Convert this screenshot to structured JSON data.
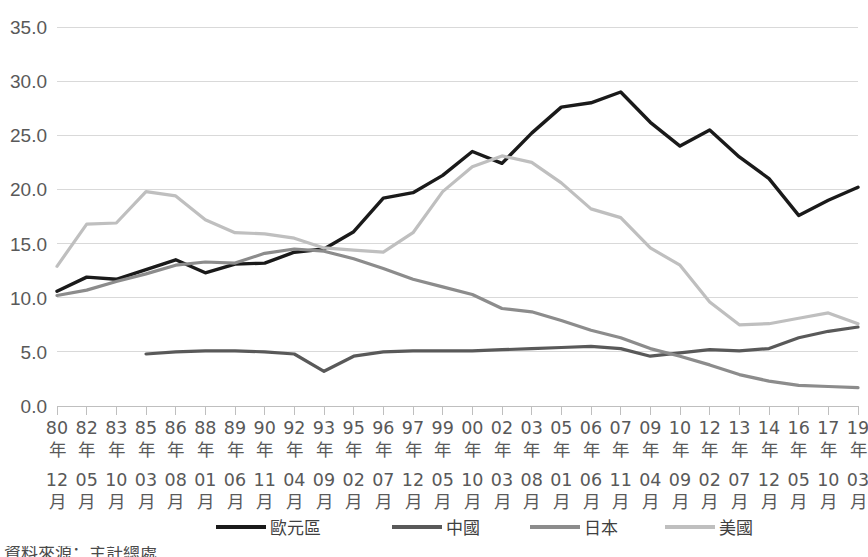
{
  "chart_data": {
    "type": "line",
    "title": "",
    "subtitle": "",
    "xlabel": "",
    "ylabel": "",
    "grid": true,
    "legend_position": "bottom",
    "ylim": [
      0.0,
      35.0
    ],
    "yticks": [
      "0.0",
      "5.0",
      "10.0",
      "15.0",
      "20.0",
      "25.0",
      "30.0",
      "35.0"
    ],
    "ytick_values": [
      0.0,
      5.0,
      10.0,
      15.0,
      20.0,
      25.0,
      30.0,
      35.0
    ],
    "categories": [
      "80年12月",
      "82年05月",
      "83年10月",
      "85年03月",
      "86年08月",
      "88年01月",
      "89年06月",
      "90年11月",
      "92年04月",
      "93年09月",
      "95年02月",
      "96年07月",
      "97年12月",
      "99年05月",
      "00年10月",
      "02年03月",
      "03年08月",
      "05年01月",
      "06年06月",
      "07年11月",
      "09年04月",
      "10年09月",
      "12年02月",
      "13年07月",
      "14年12月",
      "16年05月",
      "17年10月",
      "19年03月"
    ],
    "series": [
      {
        "name": "歐元區",
        "color": "#1a1a1a",
        "width": 3.4,
        "dash": "",
        "values": [
          10.6,
          11.9,
          11.7,
          12.6,
          13.5,
          12.3,
          13.1,
          13.2,
          14.2,
          14.5,
          16.1,
          19.2,
          19.7,
          21.3,
          23.5,
          22.4,
          25.2,
          27.6,
          28.0,
          29.0,
          26.2,
          24.0,
          25.5,
          23.0,
          21.0,
          17.6,
          19.0,
          20.2
        ]
      },
      {
        "name": "中國",
        "color": "#595959",
        "width": 3.2,
        "dash": "",
        "values": [
          null,
          null,
          null,
          4.8,
          5.0,
          5.1,
          5.1,
          5.0,
          4.8,
          3.2,
          4.6,
          5.0,
          5.1,
          5.1,
          5.1,
          5.2,
          5.3,
          5.4,
          5.5,
          5.3,
          4.6,
          4.9,
          5.2,
          5.1,
          5.3,
          6.3,
          6.9,
          7.3
        ]
      },
      {
        "name": "日本",
        "color": "#8c8c8c",
        "width": 3.2,
        "dash": "",
        "values": [
          10.2,
          10.7,
          11.5,
          12.2,
          13.0,
          13.3,
          13.2,
          14.1,
          14.5,
          14.3,
          13.6,
          12.7,
          11.7,
          11.0,
          10.3,
          9.0,
          8.7,
          7.9,
          7.0,
          6.3,
          5.3,
          4.6,
          3.8,
          2.9,
          2.3,
          1.9,
          1.8,
          1.7
        ]
      },
      {
        "name": "美國",
        "color": "#bfbfbf",
        "width": 3.2,
        "dash": "",
        "values": [
          12.9,
          16.8,
          16.9,
          19.8,
          19.4,
          17.2,
          16.0,
          15.9,
          15.5,
          14.6,
          14.4,
          14.2,
          16.0,
          19.8,
          22.1,
          23.1,
          22.5,
          20.6,
          18.2,
          17.4,
          14.6,
          13.0,
          9.6,
          7.5,
          7.6,
          8.1,
          8.6,
          7.6
        ]
      }
    ]
  },
  "axis": {
    "y_tick_labels": [
      "35.0",
      "30.0",
      "25.0",
      "20.0",
      "15.0",
      "10.0",
      "5.0",
      "0.0"
    ],
    "x_tick_labels": [
      [
        "80年",
        "12月"
      ],
      [
        "82年",
        "05月"
      ],
      [
        "83年",
        "10月"
      ],
      [
        "85年",
        "03月"
      ],
      [
        "86年",
        "08月"
      ],
      [
        "88年",
        "01月"
      ],
      [
        "89年",
        "06月"
      ],
      [
        "90年",
        "11月"
      ],
      [
        "92年",
        "04月"
      ],
      [
        "93年",
        "09月"
      ],
      [
        "95年",
        "02月"
      ],
      [
        "96年",
        "07月"
      ],
      [
        "97年",
        "12月"
      ],
      [
        "99年",
        "05月"
      ],
      [
        "00年",
        "10月"
      ],
      [
        "02年",
        "03月"
      ],
      [
        "03年",
        "08月"
      ],
      [
        "05年",
        "01月"
      ],
      [
        "06年",
        "06月"
      ],
      [
        "07年",
        "11月"
      ],
      [
        "09年",
        "04月"
      ],
      [
        "10年",
        "09月"
      ],
      [
        "12年",
        "02月"
      ],
      [
        "13年",
        "07月"
      ],
      [
        "14年",
        "12月"
      ],
      [
        "16年",
        "05月"
      ],
      [
        "17年",
        "10月"
      ],
      [
        "19年",
        "03月"
      ]
    ]
  },
  "legend": {
    "items": [
      {
        "label": "歐元區",
        "color": "#1a1a1a"
      },
      {
        "label": "中國",
        "color": "#595959"
      },
      {
        "label": "日本",
        "color": "#8c8c8c"
      },
      {
        "label": "美國",
        "color": "#bfbfbf"
      }
    ]
  },
  "footnote": {
    "text": "資料來源：主計總處"
  }
}
